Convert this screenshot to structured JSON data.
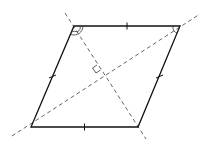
{
  "diagram": {
    "type": "rhombus-with-diagonals",
    "vertices": {
      "top_left": [
        74,
        26
      ],
      "top_right": [
        180,
        26
      ],
      "bottom_right": [
        138,
        127
      ],
      "bottom_left": [
        31,
        127
      ]
    },
    "sides_equal": true,
    "tick_marks_per_side": 1,
    "diagonals": [
      {
        "name": "bisector-top-left",
        "from": [
          65,
          13
        ],
        "to": [
          146,
          139
        ],
        "style": "dashed"
      },
      {
        "name": "diagonal-bottom-left-top-right",
        "from": [
          12,
          136
        ],
        "to": [
          200,
          14
        ],
        "style": "dashed"
      }
    ],
    "annotations": {
      "angle_marks_top_left": "double arc (angle bisected)",
      "angle_mark_top_right": "single arc",
      "right_angle_at_intersection": true
    },
    "colors": {
      "sides": "#111111",
      "diagonals": "#555555",
      "background": "#ffffff"
    }
  }
}
